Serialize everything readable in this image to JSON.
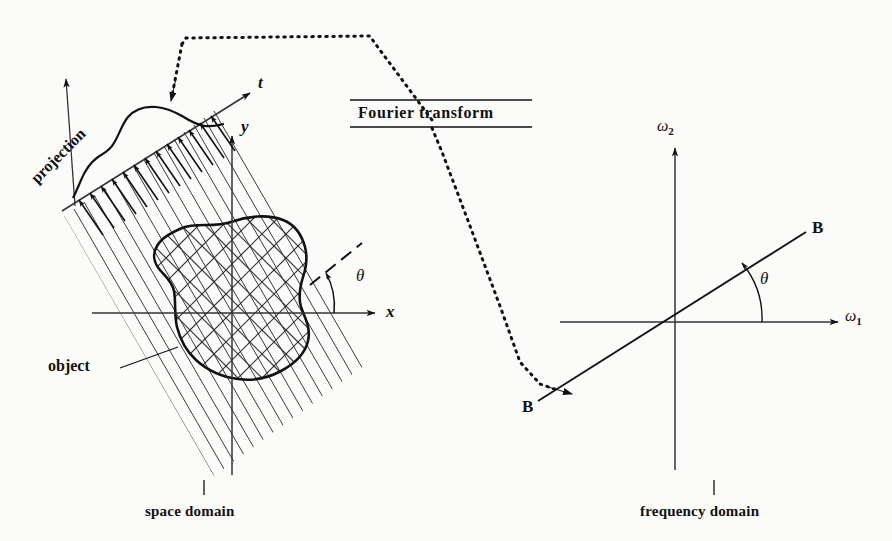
{
  "figure": {
    "title_caption_left": "space domain",
    "title_caption_right": "frequency domain",
    "transform_label": "Fourier transform"
  },
  "space_domain": {
    "axis_x_label": "x",
    "axis_y_label": "y",
    "axis_t_label": "t",
    "angle_label": "θ",
    "projection_label": "projection",
    "object_label": "object",
    "caption": "space domain",
    "projection_angle_deg": 30,
    "ray_count": 16
  },
  "frequency_domain": {
    "axis_w1_label": "ω",
    "axis_w1_sub": "1",
    "axis_w2_label": "ω",
    "axis_w2_sub": "2",
    "angle_label": "θ",
    "line_label_upper": "B",
    "line_label_lower": "B",
    "caption": "frequency domain",
    "line_angle_deg": 30
  },
  "colors": {
    "ink": "#111111",
    "paper": "#fbfbfa",
    "hatch": "#333333"
  }
}
